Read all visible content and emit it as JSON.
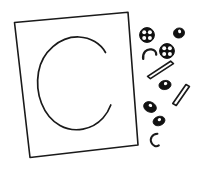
{
  "canvas": {
    "width": 198,
    "height": 170,
    "background_color": "#ffffff",
    "ink_color": "#1a1a1a",
    "style": "hand-drawn black ink line art, no text labels"
  },
  "scene": {
    "title": "Hand-drawn letter C on a tilted card with scattered food pieces",
    "description": "A slightly rotated rectangular card outline encloses a large open letter C. To the right of the card, assorted small ingredient shapes are scattered."
  },
  "card": {
    "name": "tilted rectangle card",
    "corners": {
      "top_left": [
        14,
        22
      ],
      "top_right": [
        128,
        12
      ],
      "bottom_right": [
        138,
        145
      ],
      "bottom_left": [
        30,
        157
      ]
    },
    "stroke_width": 1.6,
    "fill": "#ffffff"
  },
  "letter": {
    "glyph": "C",
    "center": [
      74,
      84
    ],
    "radius_x": 38,
    "radius_y": 46,
    "gap_side": "right",
    "stroke_width": 1.6
  },
  "items": [
    {
      "id": "slice-1",
      "label": "round seeded slice",
      "shape": "circle-with-dots",
      "center": [
        147,
        35
      ],
      "radius": 7.5,
      "dot_count": 4
    },
    {
      "id": "blob-1",
      "label": "small dark oval",
      "shape": "oval",
      "center": [
        179,
        33
      ],
      "radius_x": 5.5,
      "radius_y": 5.0,
      "rotation": -15
    },
    {
      "id": "slice-2",
      "label": "round seeded slice",
      "shape": "circle-with-dots",
      "center": [
        167,
        51
      ],
      "radius": 7.5,
      "dot_count": 4
    },
    {
      "id": "curve-1",
      "label": "small curved macaroni",
      "shape": "crescent",
      "center": [
        150,
        55
      ],
      "radius": 6.0,
      "rotation": 20
    },
    {
      "id": "stick-1",
      "label": "long thin stick",
      "shape": "elongated-parallelogram",
      "center": [
        160,
        69
      ],
      "length": 26,
      "thickness": 5,
      "rotation": -22
    },
    {
      "id": "blob-2",
      "label": "small dark oval",
      "shape": "oval",
      "center": [
        165,
        85
      ],
      "radius_x": 6.0,
      "radius_y": 4.5,
      "rotation": -10
    },
    {
      "id": "stick-2",
      "label": "long thin stick",
      "shape": "elongated-parallelogram",
      "center": [
        180,
        94
      ],
      "length": 24,
      "thickness": 5,
      "rotation": -55
    },
    {
      "id": "blob-3",
      "label": "small dark oval",
      "shape": "oval",
      "center": [
        150,
        107
      ],
      "radius_x": 6.5,
      "radius_y": 5.0,
      "rotation": 25
    },
    {
      "id": "blob-4",
      "label": "small dark oval",
      "shape": "oval",
      "center": [
        159,
        121
      ],
      "radius_x": 6.0,
      "radius_y": 4.5,
      "rotation": -20
    },
    {
      "id": "curve-2",
      "label": "small curved macaroni",
      "shape": "crescent",
      "center": [
        155,
        140
      ],
      "radius": 5.5,
      "rotation": -30
    }
  ]
}
